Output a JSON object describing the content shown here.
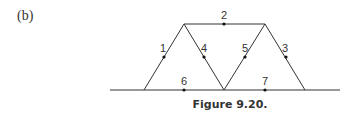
{
  "panel_label": "(b)",
  "caption": "Figure 9.20.",
  "members": [
    {
      "id": "1",
      "label": "1"
    },
    {
      "id": "2",
      "label": "2"
    },
    {
      "id": "3",
      "label": "3"
    },
    {
      "id": "4",
      "label": "4"
    },
    {
      "id": "5",
      "label": "5"
    },
    {
      "id": "6",
      "label": "6"
    },
    {
      "id": "7",
      "label": "7"
    }
  ]
}
